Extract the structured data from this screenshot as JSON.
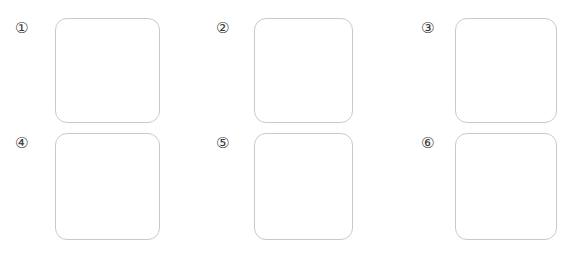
{
  "page": {
    "background_color": "#ffffff",
    "width": 573,
    "height": 257
  },
  "style": {
    "box_border_color": "#c9c9c9",
    "box_fill_color": "#ffffff",
    "label_color": "#3a3a3a",
    "box_corner_radius": "12px"
  },
  "grid": {
    "rows": 2,
    "columns": 3,
    "total_cells": 6,
    "cells": [
      {
        "label": "①",
        "number": "1",
        "name": "cell-1",
        "content": ""
      },
      {
        "label": "②",
        "number": "2",
        "name": "cell-2",
        "content": ""
      },
      {
        "label": "③",
        "number": "3",
        "name": "cell-3",
        "content": ""
      },
      {
        "label": "④",
        "number": "4",
        "name": "cell-4",
        "content": ""
      },
      {
        "label": "⑤",
        "number": "5",
        "name": "cell-5",
        "content": ""
      },
      {
        "label": "⑥",
        "number": "6",
        "name": "cell-6",
        "content": ""
      }
    ]
  }
}
